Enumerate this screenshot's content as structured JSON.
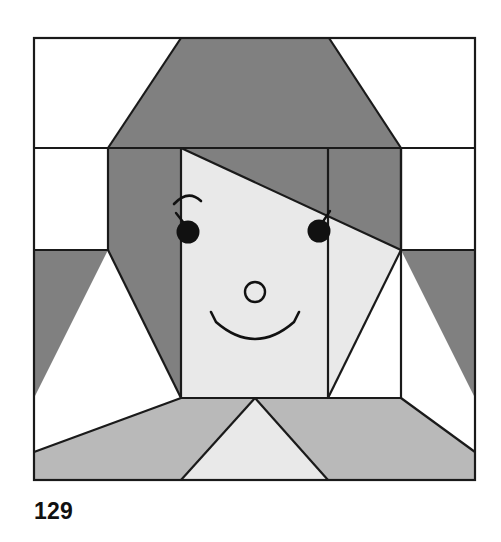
{
  "page": {
    "caption": "129",
    "background_color": "#ffffff"
  },
  "palette": {
    "background": "#ffffff",
    "hair_dark": "#808080",
    "body_medium": "#b9b9b9",
    "face_light": "#e9e9e9",
    "outline": "#1a1a1a",
    "caption_color": "#111111"
  },
  "block": {
    "name": "girl-face-quilt-block",
    "frame": {
      "x": 34,
      "y": 38,
      "width": 441,
      "height": 442
    },
    "grid_columns": 6,
    "grid_rows": 6,
    "patches": [
      {
        "name": "top-left-white-corner",
        "color": "#ffffff",
        "points": "34,38 181,38 34,148"
      },
      {
        "name": "top-right-white-corner",
        "color": "#ffffff",
        "points": "329,38 475,38 475,148"
      },
      {
        "name": "hair-crown",
        "color": "#808080",
        "points": "181,38 329,38 401,148 108,148"
      },
      {
        "name": "left-white-side",
        "color": "#ffffff",
        "points": "34,148 108,148 108,250 34,250"
      },
      {
        "name": "right-white-side",
        "color": "#ffffff",
        "points": "401,148 475,148 475,250 401,250"
      },
      {
        "name": "hair-left-upper",
        "color": "#808080",
        "points": "108,148 181,148 181,398 108,148"
      },
      {
        "name": "hair-left-panel",
        "color": "#808080",
        "points": "108,148 181,148 181,398 108,398"
      },
      {
        "name": "hair-right-panel",
        "color": "#808080",
        "points": "328,148 401,148 401,398 328,398"
      },
      {
        "name": "hair-swoop-diagonal",
        "color": "#808080",
        "points": "181,148 401,148 401,250 181,148"
      },
      {
        "name": "face-light",
        "color": "#e9e9e9",
        "points": "181,148 401,250 401,398 181,398"
      },
      {
        "name": "hair-left-outer-wedge",
        "color": "#808080",
        "points": "34,250 108,250 181,398 34,398"
      },
      {
        "name": "hair-right-outer-wedge",
        "color": "#808080",
        "points": "401,250 475,250 475,398 328,398"
      },
      {
        "name": "left-white-triangle",
        "color": "#ffffff",
        "points": "108,250 181,398 34,398"
      },
      {
        "name": "right-white-triangle",
        "color": "#ffffff",
        "points": "401,250 475,398 328,398"
      },
      {
        "name": "body-left",
        "color": "#b9b9b9",
        "points": "34,398 181,398 255,398 34,452"
      },
      {
        "name": "body-right",
        "color": "#b9b9b9",
        "points": "255,398 401,398 475,452 475,480"
      },
      {
        "name": "neck-triangle",
        "color": "#e9e9e9",
        "points": "255,398 328,480 181,480"
      }
    ],
    "face_features": [
      {
        "name": "left-eyebrow",
        "type": "arc"
      },
      {
        "name": "left-eye-pupil",
        "type": "filled-circle",
        "cx": 187,
        "cy": 232,
        "r": 11
      },
      {
        "name": "left-eyelash",
        "type": "line"
      },
      {
        "name": "right-eye-pupil",
        "type": "filled-circle",
        "cx": 319,
        "cy": 231,
        "r": 11
      },
      {
        "name": "right-eyelash",
        "type": "line"
      },
      {
        "name": "nose",
        "type": "circle-outline",
        "cx": 255,
        "cy": 292,
        "r": 10
      },
      {
        "name": "smile",
        "type": "arc"
      }
    ]
  }
}
